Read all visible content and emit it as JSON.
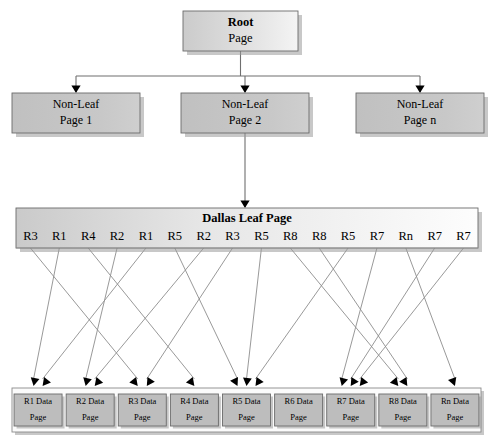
{
  "diagram": {
    "type": "tree-diagram",
    "canvas": {
      "width": 493,
      "height": 439
    },
    "colors": {
      "root_fill_start": "#cfcfcf",
      "root_fill_end": "#f2f2f2",
      "nonleaf_fill": "#c3c3c3",
      "leaf_fill_start": "#c9c9c9",
      "leaf_fill_end": "#fdfdfd",
      "datapage_fill": "#bdbdbd",
      "container_fill": "#fbfbfb",
      "connector": "#8d8d8d",
      "arrow": "#000000",
      "border": "#6b6b6b",
      "shadow": "#9a9a9a",
      "background": "#ffffff"
    },
    "root": {
      "line1": "Root",
      "line2": "Page",
      "x": 183,
      "y": 11,
      "w": 115,
      "h": 40
    },
    "nonleaf": [
      {
        "line1": "Non-Leaf",
        "line2": "Page 1",
        "x": 12,
        "y": 93,
        "w": 128,
        "h": 40
      },
      {
        "line1": "Non-Leaf",
        "line2": "Page 2",
        "x": 181,
        "y": 93,
        "w": 128,
        "h": 40
      },
      {
        "line1": "Non-Leaf",
        "line2": "Page n",
        "x": 356,
        "y": 93,
        "w": 128,
        "h": 40
      }
    ],
    "leaf": {
      "title": "Dallas Leaf Page",
      "x": 16,
      "y": 208,
      "w": 462,
      "h": 40,
      "slots": [
        {
          "label": "R3",
          "target": 2
        },
        {
          "label": "R1",
          "target": 0
        },
        {
          "label": "R4",
          "target": 3
        },
        {
          "label": "R2",
          "target": 1
        },
        {
          "label": "R1",
          "target": 0
        },
        {
          "label": "R5",
          "target": 4
        },
        {
          "label": "R2",
          "target": 1
        },
        {
          "label": "R3",
          "target": 2
        },
        {
          "label": "R5",
          "target": 4
        },
        {
          "label": "R8",
          "target": 7
        },
        {
          "label": "R8",
          "target": 7
        },
        {
          "label": "R5",
          "target": 4
        },
        {
          "label": "R7",
          "target": 6
        },
        {
          "label": "Rn",
          "target": 8
        },
        {
          "label": "R7",
          "target": 6
        },
        {
          "label": "R7",
          "target": 6
        }
      ]
    },
    "datapages_container": {
      "x": 12,
      "y": 388,
      "w": 469,
      "h": 44
    },
    "datapages": [
      {
        "line1": "R1 Data",
        "line2": "Page"
      },
      {
        "line1": "R2 Data",
        "line2": "Page"
      },
      {
        "line1": "R3 Data",
        "line2": "Page"
      },
      {
        "line1": "R4 Data",
        "line2": "Page"
      },
      {
        "line1": "R5 Data",
        "line2": "Page"
      },
      {
        "line1": "R6 Data",
        "line2": "Page"
      },
      {
        "line1": "R7 Data",
        "line2": "Page"
      },
      {
        "line1": "R8 Data",
        "line2": "Page"
      },
      {
        "line1": "Rn Data",
        "line2": "Page"
      }
    ]
  }
}
